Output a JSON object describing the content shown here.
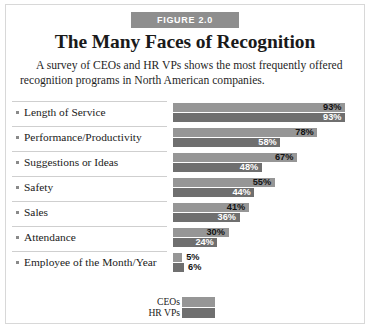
{
  "figure": {
    "banner_label": "FIGURE 2.0",
    "title": "The Many Faces of Recognition",
    "subtitle": "A survey of CEOs and HR VPs shows the most frequently offered recognition programs in North American companies."
  },
  "colors": {
    "banner_bg": "#8e8e8e",
    "ceo_bar": "#969696",
    "hr_bar": "#6f6f6f",
    "border": "#d8d8d8",
    "rule": "#cfcfcf"
  },
  "legend": {
    "entries": [
      {
        "label": "CEOs",
        "color": "#969696"
      },
      {
        "label": "HR VPs",
        "color": "#6f6f6f"
      }
    ]
  },
  "chart_data": {
    "type": "bar",
    "orientation": "horizontal",
    "title": "The Many Faces of Recognition",
    "subtitle": "A survey of CEOs and HR VPs shows the most frequently offered recognition programs in North American companies.",
    "xlabel": "",
    "ylabel": "",
    "xlim": [
      0,
      100
    ],
    "grid": false,
    "legend_position": "bottom",
    "value_suffix": "%",
    "categories": [
      "Length of Service",
      "Performance/Productivity",
      "Suggestions or Ideas",
      "Safety",
      "Sales",
      "Attendance",
      "Employee of the Month/Year"
    ],
    "series": [
      {
        "name": "CEOs",
        "color": "#969696",
        "values": [
          93,
          78,
          67,
          55,
          41,
          30,
          5
        ]
      },
      {
        "name": "HR VPs",
        "color": "#6f6f6f",
        "values": [
          93,
          58,
          48,
          44,
          36,
          24,
          6
        ]
      }
    ],
    "data_labels": [
      {
        "category": "Length of Service",
        "ceo": "93%",
        "hr": "93%"
      },
      {
        "category": "Performance/Productivity",
        "ceo": "78%",
        "hr": "58%"
      },
      {
        "category": "Suggestions or Ideas",
        "ceo": "67%",
        "hr": "48%"
      },
      {
        "category": "Safety",
        "ceo": "55%",
        "hr": "44%"
      },
      {
        "category": "Sales",
        "ceo": "41%",
        "hr": "36%"
      },
      {
        "category": "Attendance",
        "ceo": "30%",
        "hr": "24%"
      },
      {
        "category": "Employee of the Month/Year",
        "ceo": "5%",
        "hr": "6%"
      }
    ]
  }
}
